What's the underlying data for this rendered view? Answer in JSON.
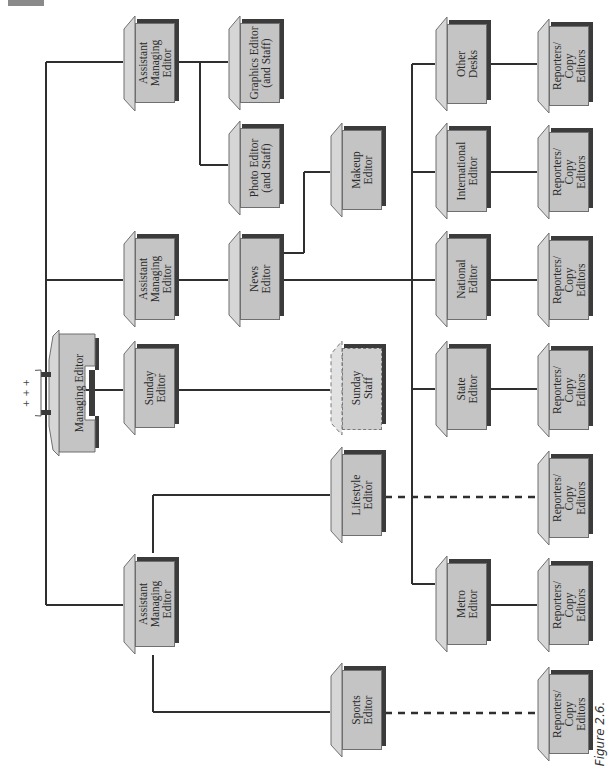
{
  "figure": {
    "caption": "Figure 2.6.",
    "orientation": "rotated 90° counter-clockwise (text reads bottom-to-top)"
  },
  "colors": {
    "box_fill": "#c4c4c4",
    "box_shadow": "#3b3b3b",
    "box_side": "#d6d6d6",
    "line": "#2f2f2f",
    "corner_tab": "#8a8a8a"
  },
  "nodes": {
    "managing_editor": {
      "label": "Managing Editor",
      "icon": "typewriter-desk-icon",
      "icon_marks": "+ + +"
    },
    "ame_top": {
      "label": "Assistant\nManaging\nEditor"
    },
    "ame_mid": {
      "label": "Assistant\nManaging\nEditor"
    },
    "sunday_editor": {
      "label": "Sunday\nEditor"
    },
    "ame_bottom": {
      "label": "Assistant\nManaging\nEditor"
    },
    "graphics_editor": {
      "label": "Graphics Editor\n(and Staff)"
    },
    "photo_editor": {
      "label": "Photo Editor\n(and Staff)"
    },
    "news_editor": {
      "label": "News\nEditor"
    },
    "makeup_editor": {
      "label": "Makeup\nEditor"
    },
    "sunday_staff": {
      "label": "Sunday\nStaff",
      "style": "dashed"
    },
    "lifestyle_editor": {
      "label": "Lifestyle\nEditor"
    },
    "sports_editor": {
      "label": "Sports\nEditor"
    },
    "other_desks": {
      "label": "Other\nDesks"
    },
    "international_editor": {
      "label": "International\nEditor"
    },
    "national_editor": {
      "label": "National\nEditor"
    },
    "state_editor": {
      "label": "State\nEditor"
    },
    "metro_editor": {
      "label": "Metro\nEditor"
    },
    "reporters_1": {
      "label": "Reporters/\nCopy\nEditors"
    },
    "reporters_2": {
      "label": "Reporters/\nCopy\nEditors"
    },
    "reporters_3": {
      "label": "Reporters/\nCopy\nEditors"
    },
    "reporters_4": {
      "label": "Reporters/\nCopy\nEditors"
    },
    "reporters_5": {
      "label": "Reporters/\nCopy\nEditors"
    },
    "reporters_6": {
      "label": "Reporters/\nCopy\nEditors"
    },
    "reporters_7": {
      "label": "Reporters/\nCopy\nEditors"
    }
  },
  "edges": [
    {
      "from": "managing_editor",
      "to": "ame_top",
      "style": "solid"
    },
    {
      "from": "managing_editor",
      "to": "ame_mid",
      "style": "solid"
    },
    {
      "from": "managing_editor",
      "to": "sunday_editor",
      "style": "solid"
    },
    {
      "from": "managing_editor",
      "to": "ame_bottom",
      "style": "solid"
    },
    {
      "from": "ame_top",
      "to": "graphics_editor",
      "style": "solid"
    },
    {
      "from": "ame_top",
      "to": "photo_editor",
      "style": "solid"
    },
    {
      "from": "ame_mid",
      "to": "news_editor",
      "style": "solid"
    },
    {
      "from": "news_editor",
      "to": "makeup_editor",
      "style": "solid"
    },
    {
      "from": "news_editor",
      "to": "other_desks",
      "style": "solid"
    },
    {
      "from": "news_editor",
      "to": "international_editor",
      "style": "solid"
    },
    {
      "from": "news_editor",
      "to": "national_editor",
      "style": "solid"
    },
    {
      "from": "news_editor",
      "to": "state_editor",
      "style": "solid"
    },
    {
      "from": "news_editor",
      "to": "metro_editor",
      "style": "solid"
    },
    {
      "from": "sunday_editor",
      "to": "sunday_staff",
      "style": "solid"
    },
    {
      "from": "ame_bottom",
      "to": "lifestyle_editor",
      "style": "solid"
    },
    {
      "from": "ame_bottom",
      "to": "sports_editor",
      "style": "solid"
    },
    {
      "from": "other_desks",
      "to": "reporters_1",
      "style": "solid"
    },
    {
      "from": "international_editor",
      "to": "reporters_2",
      "style": "solid"
    },
    {
      "from": "national_editor",
      "to": "reporters_3",
      "style": "solid"
    },
    {
      "from": "state_editor",
      "to": "reporters_4",
      "style": "solid"
    },
    {
      "from": "lifestyle_editor",
      "to": "reporters_5",
      "style": "dashed"
    },
    {
      "from": "metro_editor",
      "to": "reporters_6",
      "style": "solid"
    },
    {
      "from": "sports_editor",
      "to": "reporters_7",
      "style": "dashed"
    }
  ]
}
